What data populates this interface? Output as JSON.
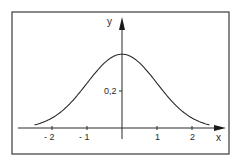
{
  "chart_data": {
    "type": "line",
    "title": "",
    "xlabel": "x",
    "ylabel": "y",
    "function": "standard normal density y = exp(-x^2/2)/sqrt(2*pi)",
    "xlim": [
      -2.5,
      2.5
    ],
    "ylim": [
      0,
      0.4
    ],
    "x_ticks": [
      -2,
      -1,
      1,
      2
    ],
    "x_tick_labels": [
      "- 2",
      "- 1",
      "1",
      "2"
    ],
    "y_ticks": [
      0.2
    ],
    "y_tick_labels": [
      "0,2"
    ],
    "grid": false,
    "legend": "none",
    "series": [
      {
        "name": "normal-density",
        "x": [
          -2.5,
          -2.25,
          -2.0,
          -1.75,
          -1.5,
          -1.25,
          -1.0,
          -0.75,
          -0.5,
          -0.25,
          0,
          0.25,
          0.5,
          0.75,
          1.0,
          1.25,
          1.5,
          1.75,
          2.0,
          2.25,
          2.5
        ],
        "y": [
          0.0175,
          0.0317,
          0.054,
          0.0863,
          0.1295,
          0.1826,
          0.242,
          0.3011,
          0.3521,
          0.3867,
          0.3989,
          0.3867,
          0.3521,
          0.3011,
          0.242,
          0.1826,
          0.1295,
          0.0863,
          0.054,
          0.0317,
          0.0175
        ]
      }
    ]
  }
}
